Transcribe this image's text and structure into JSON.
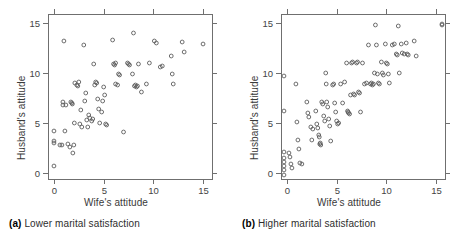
{
  "figure": {
    "background": "#ffffff",
    "axis_color": "#6f6f6f",
    "point_color": "#5e5e5e"
  },
  "panels": [
    {
      "key": "a",
      "caption_label": "(a)",
      "caption_text": "Lower marital satisfaction",
      "xlabel": "Wife's attitude",
      "ylabel": "Husband's attitude"
    },
    {
      "key": "b",
      "caption_label": "(b)",
      "caption_text": "Higher marital satisfaction",
      "xlabel": "Wife's attitude",
      "ylabel": "Husband's attitude"
    }
  ],
  "chart_data": [
    {
      "type": "scatter",
      "title": "(a) Lower marital satisfaction",
      "xlabel": "Wife's attitude",
      "ylabel": "Husband's attitude",
      "xlim": [
        -0.6,
        15.9
      ],
      "ylim": [
        -0.6,
        15.9
      ],
      "xticks": [
        0,
        5,
        10,
        15
      ],
      "yticks": [
        0,
        5,
        10,
        15
      ],
      "xticklabels": [
        "0",
        "5",
        "10",
        "15"
      ],
      "yticklabels": [
        "0",
        "5",
        "10",
        "15"
      ],
      "grid": false,
      "legend": null,
      "marker": "open-circle",
      "points": [
        [
          0.0,
          4.2
        ],
        [
          0.0,
          3.2
        ],
        [
          0.0,
          3.0
        ],
        [
          0.0,
          0.7
        ],
        [
          0.6,
          2.8
        ],
        [
          0.8,
          2.8
        ],
        [
          0.9,
          7.1
        ],
        [
          0.9,
          6.8
        ],
        [
          1.0,
          13.2
        ],
        [
          1.1,
          4.2
        ],
        [
          1.2,
          6.8
        ],
        [
          1.4,
          2.9
        ],
        [
          1.6,
          2.6
        ],
        [
          1.7,
          7.1
        ],
        [
          1.8,
          7.0
        ],
        [
          1.85,
          6.9
        ],
        [
          1.9,
          2.0
        ],
        [
          2.0,
          2.8
        ],
        [
          2.05,
          5.0
        ],
        [
          2.1,
          9.0
        ],
        [
          2.3,
          8.8
        ],
        [
          2.4,
          8.7
        ],
        [
          2.5,
          9.1
        ],
        [
          2.6,
          4.9
        ],
        [
          2.7,
          6.3
        ],
        [
          2.8,
          4.6
        ],
        [
          3.0,
          12.8
        ],
        [
          3.1,
          7.2
        ],
        [
          3.2,
          8.0
        ],
        [
          3.3,
          5.3
        ],
        [
          3.4,
          4.6
        ],
        [
          3.5,
          5.8
        ],
        [
          3.6,
          5.5
        ],
        [
          3.8,
          5.2
        ],
        [
          3.9,
          5.4
        ],
        [
          4.0,
          10.9
        ],
        [
          4.1,
          8.8
        ],
        [
          4.2,
          9.1
        ],
        [
          4.3,
          9.0
        ],
        [
          4.4,
          7.4
        ],
        [
          4.5,
          6.4
        ],
        [
          4.6,
          5.0
        ],
        [
          4.8,
          6.1
        ],
        [
          4.9,
          7.2
        ],
        [
          5.0,
          8.6
        ],
        [
          5.1,
          7.8
        ],
        [
          5.2,
          4.9
        ],
        [
          5.3,
          4.8
        ],
        [
          5.9,
          13.3
        ],
        [
          6.0,
          10.9
        ],
        [
          6.1,
          10.8
        ],
        [
          6.2,
          11.0
        ],
        [
          6.2,
          8.9
        ],
        [
          6.4,
          8.8
        ],
        [
          6.5,
          9.9
        ],
        [
          6.6,
          9.8
        ],
        [
          7.0,
          4.1
        ],
        [
          7.4,
          11.0
        ],
        [
          7.5,
          10.9
        ],
        [
          7.6,
          10.8
        ],
        [
          7.9,
          9.9
        ],
        [
          8.0,
          14.0
        ],
        [
          8.1,
          8.7
        ],
        [
          8.2,
          8.8
        ],
        [
          8.3,
          8.6
        ],
        [
          8.4,
          8.7
        ],
        [
          8.5,
          10.9
        ],
        [
          8.8,
          8.1
        ],
        [
          9.3,
          8.9
        ],
        [
          9.6,
          11.0
        ],
        [
          10.1,
          13.2
        ],
        [
          10.3,
          13.0
        ],
        [
          10.7,
          10.6
        ],
        [
          10.9,
          10.7
        ],
        [
          11.8,
          11.7
        ],
        [
          11.9,
          9.9
        ],
        [
          12.0,
          8.9
        ],
        [
          12.9,
          13.1
        ],
        [
          13.1,
          12.1
        ],
        [
          15.0,
          12.9
        ]
      ]
    },
    {
      "type": "scatter",
      "title": "(b) Higher marital satisfaction",
      "xlabel": "Wife's attitude",
      "ylabel": "Husband's attitude",
      "xlim": [
        -0.6,
        15.9
      ],
      "ylim": [
        -0.6,
        15.9
      ],
      "xticks": [
        0,
        5,
        10,
        15
      ],
      "yticks": [
        0,
        5,
        10,
        15
      ],
      "xticklabels": [
        "0",
        "5",
        "10",
        "15"
      ],
      "yticklabels": [
        "0",
        "5",
        "10",
        "15"
      ],
      "grid": false,
      "legend": null,
      "marker": "open-circle",
      "points": [
        [
          -0.3,
          9.7
        ],
        [
          -0.3,
          6.2
        ],
        [
          -0.3,
          2.1
        ],
        [
          -0.3,
          1.5
        ],
        [
          -0.3,
          1.1
        ],
        [
          -0.3,
          0.7
        ],
        [
          -0.3,
          0.3
        ],
        [
          -0.3,
          -0.2
        ],
        [
          0.2,
          2.0
        ],
        [
          0.3,
          1.6
        ],
        [
          0.4,
          0.9
        ],
        [
          0.5,
          0.5
        ],
        [
          0.9,
          8.9
        ],
        [
          1.0,
          5.1
        ],
        [
          1.1,
          3.3
        ],
        [
          1.2,
          2.4
        ],
        [
          1.3,
          1.0
        ],
        [
          1.5,
          0.9
        ],
        [
          2.0,
          7.1
        ],
        [
          2.1,
          6.0
        ],
        [
          2.2,
          5.6
        ],
        [
          2.4,
          4.6
        ],
        [
          2.5,
          3.3
        ],
        [
          2.6,
          4.4
        ],
        [
          2.9,
          6.2
        ],
        [
          3.0,
          4.9
        ],
        [
          3.1,
          4.5
        ],
        [
          3.2,
          3.8
        ],
        [
          3.25,
          3.6
        ],
        [
          3.3,
          2.9
        ],
        [
          3.35,
          3.0
        ],
        [
          3.4,
          2.8
        ],
        [
          3.5,
          7.1
        ],
        [
          3.6,
          6.9
        ],
        [
          3.7,
          5.7
        ],
        [
          3.8,
          5.2
        ],
        [
          3.9,
          10.0
        ],
        [
          3.95,
          8.9
        ],
        [
          4.0,
          7.1
        ],
        [
          4.1,
          6.6
        ],
        [
          4.2,
          5.4
        ],
        [
          4.3,
          4.7
        ],
        [
          4.4,
          3.2
        ],
        [
          4.6,
          8.8
        ],
        [
          4.7,
          8.9
        ],
        [
          4.8,
          7.0
        ],
        [
          4.9,
          6.1
        ],
        [
          5.0,
          5.2
        ],
        [
          5.1,
          4.9
        ],
        [
          5.2,
          5.0
        ],
        [
          5.4,
          8.9
        ],
        [
          5.6,
          7.0
        ],
        [
          5.8,
          9.1
        ],
        [
          6.0,
          11.0
        ],
        [
          6.1,
          6.2
        ],
        [
          6.15,
          6.1
        ],
        [
          6.2,
          6.0
        ],
        [
          6.3,
          5.9
        ],
        [
          6.4,
          7.8
        ],
        [
          6.5,
          11.0
        ],
        [
          6.6,
          11.1
        ],
        [
          6.7,
          7.9
        ],
        [
          6.8,
          7.8
        ],
        [
          7.0,
          11.0
        ],
        [
          7.1,
          11.1
        ],
        [
          7.2,
          8.1
        ],
        [
          7.3,
          8.0
        ],
        [
          7.4,
          6.1
        ],
        [
          7.6,
          11.0
        ],
        [
          7.8,
          8.9
        ],
        [
          8.0,
          9.0
        ],
        [
          8.2,
          12.8
        ],
        [
          8.4,
          8.9
        ],
        [
          8.5,
          9.0
        ],
        [
          8.6,
          8.8
        ],
        [
          8.7,
          8.9
        ],
        [
          8.8,
          10.0
        ],
        [
          8.9,
          14.8
        ],
        [
          9.0,
          12.8
        ],
        [
          9.1,
          9.9
        ],
        [
          9.2,
          9.0
        ],
        [
          9.3,
          8.9
        ],
        [
          9.5,
          11.1
        ],
        [
          9.6,
          10.0
        ],
        [
          9.7,
          9.8
        ],
        [
          9.9,
          12.9
        ],
        [
          10.0,
          11.0
        ],
        [
          10.1,
          10.9
        ],
        [
          10.2,
          9.9
        ],
        [
          10.3,
          9.0
        ],
        [
          10.6,
          12.8
        ],
        [
          10.8,
          12.9
        ],
        [
          11.0,
          11.9
        ],
        [
          11.1,
          11.8
        ],
        [
          11.2,
          14.7
        ],
        [
          11.3,
          10.0
        ],
        [
          11.5,
          12.9
        ],
        [
          11.6,
          12.0
        ],
        [
          11.8,
          11.9
        ],
        [
          12.0,
          13.0
        ],
        [
          12.1,
          11.9
        ],
        [
          12.2,
          11.8
        ],
        [
          12.8,
          13.2
        ],
        [
          13.0,
          11.7
        ],
        [
          15.6,
          14.9
        ],
        [
          15.6,
          14.8
        ]
      ]
    }
  ]
}
